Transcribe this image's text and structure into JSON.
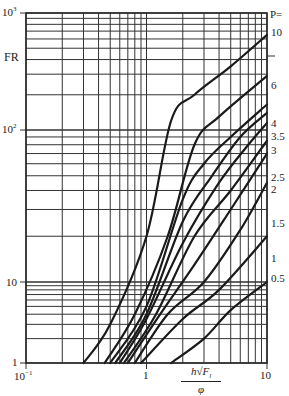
{
  "chart_data": {
    "type": "line",
    "title": "",
    "xlabel": "h√F_l / φ",
    "ylabel": "FR",
    "xscale": "log",
    "yscale": "log",
    "xlim": [
      0.1,
      10
    ],
    "ylim": [
      1,
      1000
    ],
    "grid": true,
    "legend_title": "P=",
    "x_ticks": [
      "10⁻¹",
      "1",
      "10"
    ],
    "y_ticks": [
      "1",
      "10",
      "10²",
      "10³"
    ],
    "series": [
      {
        "name": "10",
        "x": [
          0.3,
          0.5,
          1.0,
          1.6,
          2.5,
          5.0,
          10.0
        ],
        "y": [
          1,
          3,
          20,
          120,
          200,
          350,
          650
        ]
      },
      {
        "name": "6",
        "x": [
          0.45,
          0.8,
          1.5,
          2.5,
          4.0,
          10.0
        ],
        "y": [
          1,
          4,
          20,
          80,
          130,
          290
        ]
      },
      {
        "name": "4",
        "x": [
          0.5,
          1.0,
          2.0,
          3.0,
          5.0,
          10.0
        ],
        "y": [
          1,
          5,
          35,
          60,
          90,
          165
        ]
      },
      {
        "name": "3.5",
        "x": [
          0.55,
          1.0,
          2.0,
          3.5,
          6.0,
          10.0
        ],
        "y": [
          1,
          4,
          25,
          50,
          90,
          140
        ]
      },
      {
        "name": "3",
        "x": [
          0.6,
          1.0,
          2.0,
          4.0,
          7.0,
          10.0
        ],
        "y": [
          1,
          3.5,
          18,
          45,
          80,
          115
        ]
      },
      {
        "name": "2.5",
        "x": [
          0.65,
          1.2,
          2.5,
          5.0,
          10.0
        ],
        "y": [
          1,
          4,
          20,
          40,
          85
        ]
      },
      {
        "name": "2",
        "x": [
          0.7,
          1.3,
          2.5,
          5.0,
          10.0
        ],
        "y": [
          1,
          4,
          13,
          30,
          70
        ]
      },
      {
        "name": "1.5",
        "x": [
          0.8,
          1.5,
          3.0,
          6.0,
          10.0
        ],
        "y": [
          1,
          4,
          10,
          22,
          45
        ]
      },
      {
        "name": "1",
        "x": [
          0.9,
          2.0,
          4.0,
          10.0
        ],
        "y": [
          1,
          3.5,
          8,
          20
        ]
      },
      {
        "name": "0.5",
        "x": [
          1.6,
          3.0,
          5.0,
          10.0
        ],
        "y": [
          1,
          2,
          4.5,
          10
        ]
      }
    ]
  },
  "labels": {
    "y_1000": "10",
    "y_1000_exp": "3",
    "y_100": "10",
    "y_100_exp": "2",
    "y_10": "10",
    "y_1": "1",
    "x_01": "10",
    "x_01_exp": "−1",
    "x_1": "1",
    "x_10": "10",
    "ylabel": "FR",
    "xlabel_num": "h√F",
    "xlabel_sub": "l",
    "xlabel_den": "φ",
    "legend_title": "P=",
    "curve_labels": [
      "10",
      "6",
      "4",
      "3.5",
      "3",
      "2.5",
      "2",
      "1.5",
      "1",
      "0.5"
    ]
  }
}
